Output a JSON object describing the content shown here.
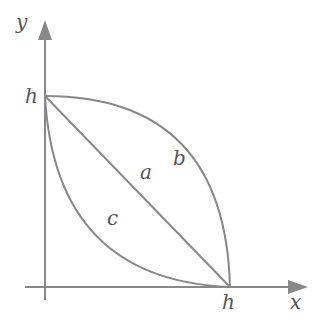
{
  "diagram": {
    "axes": {
      "x_label": "x",
      "y_label": "y"
    },
    "ticks": {
      "x_tick": "h",
      "y_tick": "h"
    },
    "curves": [
      {
        "name": "a",
        "label": "a",
        "shape": "straight line from (0,h) to (h,0)"
      },
      {
        "name": "b",
        "label": "b",
        "shape": "concave arc bulging away from origin"
      },
      {
        "name": "c",
        "label": "c",
        "shape": "convex arc bulging toward origin"
      }
    ],
    "colors": {
      "stroke": "#888888",
      "text": "#555555"
    }
  }
}
